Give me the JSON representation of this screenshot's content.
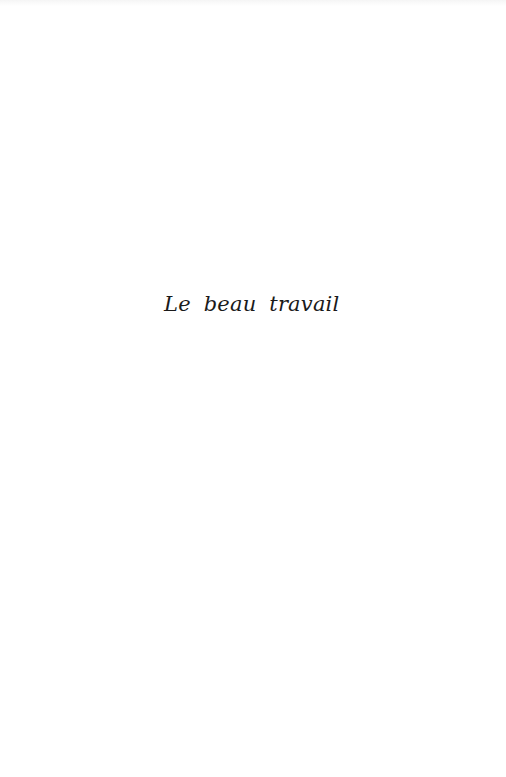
{
  "page": {
    "title": "Le beau travail"
  }
}
